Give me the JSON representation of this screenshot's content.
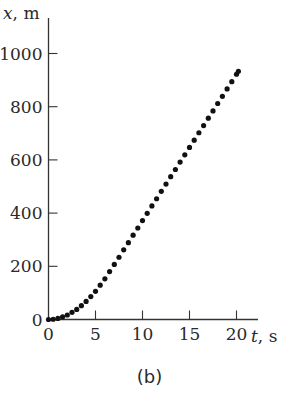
{
  "caption": "(b)",
  "chart_data": {
    "type": "scatter",
    "title": "",
    "xlabel": "t, s",
    "ylabel": "x, m",
    "xlabel_var": "t",
    "xlabel_unit": ", s",
    "ylabel_var": "x",
    "ylabel_unit": ", m",
    "xlim": [
      0,
      21
    ],
    "ylim": [
      0,
      1050
    ],
    "x_ticks": [
      0,
      5,
      10,
      15,
      20
    ],
    "y_ticks": [
      0,
      200,
      400,
      600,
      800,
      1000
    ],
    "grid": false,
    "legend": null,
    "marker_color": "#111111",
    "series": [
      {
        "name": "x(t)",
        "x": [
          0,
          0.5,
          1,
          1.5,
          2,
          2.5,
          3,
          3.5,
          4,
          4.5,
          5,
          5.5,
          6,
          6.5,
          7,
          7.5,
          8,
          8.5,
          9,
          9.5,
          10,
          10.5,
          11,
          11.5,
          12,
          12.5,
          13,
          13.5,
          14,
          14.5,
          15,
          15.5,
          16,
          16.5,
          17,
          17.5,
          18,
          18.5,
          19,
          19.5,
          20,
          20.2
        ],
        "values": [
          0,
          1,
          4,
          10,
          17,
          27,
          38,
          52,
          68,
          86,
          106,
          129,
          153,
          180,
          207,
          234,
          262,
          289,
          317,
          344,
          372,
          399,
          427,
          454,
          482,
          509,
          537,
          564,
          592,
          619,
          647,
          674,
          702,
          729,
          757,
          784,
          812,
          839,
          867,
          894,
          922,
          933
        ]
      }
    ]
  }
}
